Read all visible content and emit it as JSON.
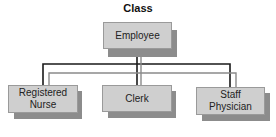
{
  "diagram": {
    "title": "Class",
    "parent": {
      "label": "Employee"
    },
    "children": [
      {
        "label": "Registered\nNurse"
      },
      {
        "label": "Clerk"
      },
      {
        "label": "Staff\nPhysician"
      }
    ],
    "colors": {
      "box_fill": "#cfcfcf",
      "box_shadow": "#8c8c8c",
      "line_dark": "#1a1a1a",
      "line_gray": "#8a8a8a"
    }
  }
}
